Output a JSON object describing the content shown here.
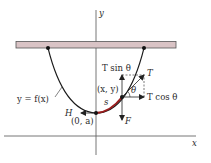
{
  "diagram": {
    "axes": {
      "x_label": "x",
      "y_label": "y"
    },
    "labels": {
      "curve": "y = f(x)",
      "lowest_point": "(0, a)",
      "point": "(x, y)",
      "arc_length": "s",
      "tension": "T",
      "tension_vertical": "T sin θ",
      "tension_horizontal": "T cos θ",
      "angle": "θ",
      "horizontal_force": "H",
      "weight_force": "F"
    },
    "colors": {
      "bar_fill": "#d9c3c5",
      "bar_stroke": "#555555",
      "curve": "#1a1a1a",
      "arc_highlight": "#9b1c1c",
      "axis": "#555555",
      "arrow": "#222222",
      "dashed": "#444444"
    }
  }
}
